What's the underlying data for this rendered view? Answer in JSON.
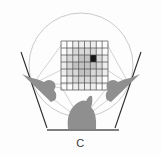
{
  "figure": {
    "panel_label": "C",
    "background_color": "#fdfdfd",
    "width": 161,
    "height": 156
  },
  "chart_data": {
    "type": "heatmap",
    "title": "C",
    "subtitle": "",
    "xlabel": "",
    "ylabel": "",
    "grid": true,
    "legend": false,
    "colorscale": {
      "empty": "#ffffff",
      "light": "#dedede",
      "mid": "#c4c4c4",
      "dark": "#a8a8a8",
      "highlight": "#161616"
    },
    "grid_dimensions": {
      "rows": 7,
      "cols": 8
    },
    "grid_bounds_px": {
      "x": 61,
      "y": 41,
      "width": 47,
      "height": 49
    },
    "highlight_cell": {
      "row": 2,
      "col": 5,
      "value": 5,
      "color": "#161616"
    },
    "cell_values": [
      [
        0,
        0,
        1,
        1,
        1,
        1,
        0,
        0
      ],
      [
        0,
        1,
        2,
        2,
        2,
        2,
        1,
        0
      ],
      [
        1,
        2,
        2,
        3,
        3,
        5,
        2,
        1
      ],
      [
        1,
        2,
        3,
        3,
        3,
        3,
        2,
        1
      ],
      [
        1,
        2,
        2,
        3,
        3,
        2,
        2,
        1
      ],
      [
        0,
        1,
        2,
        2,
        2,
        2,
        1,
        0
      ],
      [
        0,
        0,
        1,
        1,
        1,
        1,
        0,
        0
      ]
    ],
    "value_legend": [
      {
        "value": 0,
        "label": "empty",
        "color": "#ffffff"
      },
      {
        "value": 1,
        "label": "very light",
        "color": "#ededed"
      },
      {
        "value": 2,
        "label": "light",
        "color": "#d8d8d8"
      },
      {
        "value": 3,
        "label": "medium",
        "color": "#c2c2c2"
      },
      {
        "value": 5,
        "label": "highlight",
        "color": "#161616"
      }
    ]
  },
  "circle": {
    "name": "arena-circle",
    "center_x": 81,
    "center_y": 65,
    "radius": 52,
    "stroke": "#b9b9b9"
  },
  "baseline": {
    "name": "ground-baseline",
    "x1": 47,
    "x2": 119,
    "y": 130,
    "stroke": "#5a5a5a"
  },
  "subjects": [
    {
      "id": "subject-left",
      "position": "left",
      "fill": "#8f8f8f",
      "pointer_line": {
        "x1": 22,
        "y1": 55,
        "x2": 47,
        "y2": 127
      }
    },
    {
      "id": "subject-right",
      "position": "right",
      "fill": "#8f8f8f",
      "pointer_line": {
        "x1": 140,
        "y1": 55,
        "x2": 116,
        "y2": 127
      }
    },
    {
      "id": "subject-bottom",
      "position": "bottom-center",
      "fill": "#8f8f8f",
      "pointer_line": null
    }
  ],
  "sight_lines": {
    "name": "radial-sight-lines",
    "stroke": "#bdbdbd",
    "count": 8
  }
}
